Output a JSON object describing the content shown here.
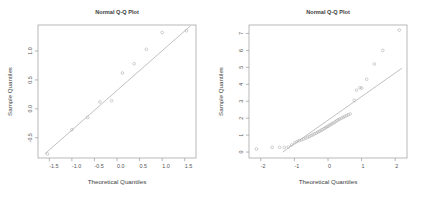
{
  "figure": {
    "panel_count": 2,
    "background": "#ffffff",
    "point_color": "#a8a8a8",
    "line_color": "#9e9e9e",
    "axis_color": "#9a9a9a"
  },
  "chart_data": [
    {
      "type": "scatter",
      "title": "Normal Q-Q Plot",
      "xlabel": "Theoretical Quantiles",
      "ylabel": "Sample Quantiles",
      "xlim": [
        -1.75,
        1.75
      ],
      "ylim": [
        -0.85,
        1.45
      ],
      "xticks": [
        -1.5,
        -1.0,
        -0.5,
        0.0,
        0.5,
        1.0,
        1.5
      ],
      "xticklabels": [
        "-1.5",
        "-1.0",
        "-0.5",
        "0.0",
        "0.5",
        "1.0",
        "1.5"
      ],
      "yticks": [
        -0.5,
        0.0,
        0.5,
        1.0
      ],
      "yticklabels": [
        "-0.5",
        "0.0",
        "0.5",
        "1.0"
      ],
      "grid": false,
      "legend": null,
      "reference_line": {
        "x": [
          -1.6,
          1.62
        ],
        "y": [
          -0.78,
          1.43
        ]
      },
      "x": [
        -1.54,
        -1.0,
        -0.65,
        -0.38,
        -0.12,
        0.12,
        0.38,
        0.65,
        1.0,
        1.54
      ],
      "y": [
        -0.78,
        -0.36,
        -0.15,
        0.12,
        0.14,
        0.62,
        0.78,
        1.03,
        1.32,
        1.35
      ]
    },
    {
      "type": "scatter",
      "title": "Normal Q-Q Plot",
      "xlabel": "Theoretical Quantiles",
      "ylabel": "Sample Quantiles",
      "xlim": [
        -2.35,
        2.35
      ],
      "ylim": [
        -0.35,
        7.5
      ],
      "xticks": [
        -2,
        -1,
        0,
        1,
        2
      ],
      "xticklabels": [
        "-2",
        "-1",
        "0",
        "1",
        "2"
      ],
      "yticks": [
        0,
        1,
        2,
        3,
        4,
        5,
        6,
        7
      ],
      "yticklabels": [
        "0",
        "1",
        "2",
        "3",
        "4",
        "5",
        "6",
        "7"
      ],
      "grid": false,
      "legend": null,
      "reference_line": {
        "x": [
          -1.35,
          2.2
        ],
        "y": [
          0.0,
          4.95
        ]
      },
      "x": [
        -2.13,
        -1.66,
        -1.44,
        -1.3,
        -1.18,
        -1.08,
        -0.99,
        -0.92,
        -0.85,
        -0.78,
        -0.72,
        -0.66,
        -0.6,
        -0.55,
        -0.5,
        -0.45,
        -0.4,
        -0.35,
        -0.3,
        -0.26,
        -0.21,
        -0.17,
        -0.12,
        -0.08,
        -0.04,
        0.0,
        0.04,
        0.08,
        0.12,
        0.17,
        0.21,
        0.26,
        0.3,
        0.35,
        0.4,
        0.45,
        0.5,
        0.55,
        0.6,
        0.66,
        0.78,
        0.85,
        0.95,
        1.0,
        1.15,
        1.38,
        1.63,
        2.12
      ],
      "y": [
        0.18,
        0.28,
        0.28,
        0.28,
        0.3,
        0.42,
        0.55,
        0.62,
        0.68,
        0.72,
        0.78,
        0.82,
        0.88,
        0.92,
        0.98,
        1.02,
        1.08,
        1.12,
        1.18,
        1.22,
        1.28,
        1.32,
        1.38,
        1.42,
        1.48,
        1.52,
        1.58,
        1.62,
        1.68,
        1.72,
        1.78,
        1.85,
        1.9,
        1.95,
        2.0,
        2.05,
        2.1,
        2.15,
        2.2,
        2.25,
        3.05,
        3.65,
        3.8,
        3.78,
        4.3,
        5.2,
        6.0,
        7.2
      ]
    }
  ]
}
